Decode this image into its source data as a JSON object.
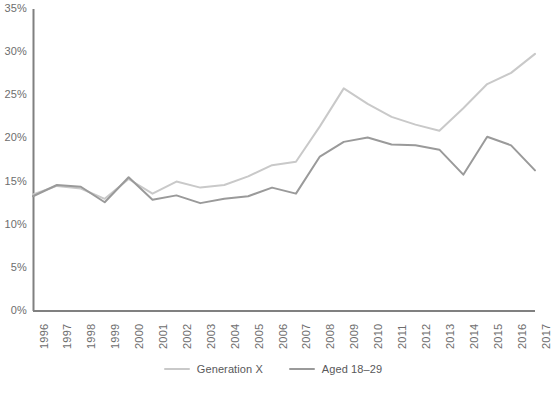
{
  "chart_data": {
    "type": "line",
    "title": "",
    "subtitle": "",
    "xlabel": "",
    "ylabel": "",
    "grid": false,
    "legend_position": "bottom",
    "x": [
      1996,
      1997,
      1998,
      1999,
      2000,
      2001,
      2002,
      2003,
      2004,
      2005,
      2006,
      2007,
      2008,
      2009,
      2010,
      2011,
      2012,
      2013,
      2014,
      2015,
      2016,
      2017
    ],
    "categories": [
      "1996",
      "1997",
      "1998",
      "1999",
      "2000",
      "2001",
      "2002",
      "2003",
      "2004",
      "2005",
      "2006",
      "2007",
      "2008",
      "2009",
      "2010",
      "2011",
      "2012",
      "2013",
      "2014",
      "2015",
      "2016",
      "2017"
    ],
    "ylim": [
      0,
      35
    ],
    "yticks": [
      0,
      5,
      10,
      15,
      20,
      25,
      30,
      35
    ],
    "ytick_labels": [
      "0%",
      "5%",
      "10%",
      "15%",
      "20%",
      "25%",
      "30%",
      "35%"
    ],
    "ytick_unit": "%",
    "series": [
      {
        "name": "Generation X",
        "color": "#c9c9c9",
        "values": [
          13.5,
          14.5,
          14.2,
          13.0,
          15.3,
          13.6,
          15.0,
          14.3,
          14.6,
          15.6,
          16.9,
          17.3,
          21.4,
          25.8,
          24.0,
          22.5,
          21.6,
          20.9,
          23.5,
          26.3,
          27.6,
          29.8
        ]
      },
      {
        "name": "Aged 18–29",
        "color": "#9a9a9a",
        "values": [
          13.3,
          14.6,
          14.4,
          12.6,
          15.5,
          12.9,
          13.4,
          12.5,
          13.0,
          13.3,
          14.3,
          13.6,
          17.9,
          19.6,
          20.1,
          19.3,
          19.2,
          18.7,
          15.8,
          20.2,
          19.2,
          16.3
        ]
      }
    ]
  },
  "axes": {
    "y_axis_color": "#808080",
    "x_axis_color": "#808080",
    "tick_label_color": "#6d6d6d"
  },
  "legend": {
    "entries": [
      {
        "label": "Generation X",
        "color": "#c9c9c9"
      },
      {
        "label": "Aged 18–29",
        "color": "#9a9a9a"
      }
    ]
  }
}
